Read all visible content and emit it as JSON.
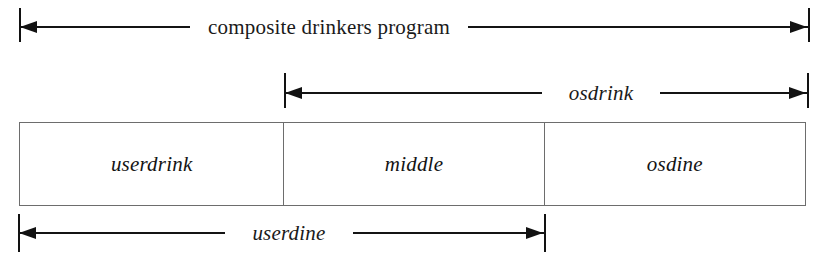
{
  "diagram": {
    "background_color": "#ffffff",
    "line_color": "#121212",
    "box_border_color": "#6d6d6d",
    "measures": [
      {
        "id": "composite-drinkers-program",
        "label": "composite drinkers program",
        "style": "roman",
        "start_x": 19,
        "end_x": 810,
        "line_y": 27,
        "tick_top": 8,
        "tick_height": 34,
        "label_center_x": 410,
        "arrow_ends": "both"
      },
      {
        "id": "osdrink",
        "label": "osdrink",
        "style": "italic",
        "start_x": 284,
        "end_x": 809,
        "line_y": 93,
        "tick_top": 73,
        "tick_height": 35,
        "label_center_x": 592,
        "arrow_ends": "both"
      },
      {
        "id": "userdine",
        "label": "userdine",
        "style": "italic",
        "start_x": 18,
        "end_x": 546,
        "line_y": 233,
        "tick_top": 214,
        "tick_height": 38,
        "label_center_x": 283,
        "arrow_ends": "both"
      }
    ],
    "bar": {
      "left": 19,
      "top": 122,
      "width": 787,
      "height": 84,
      "segments": [
        {
          "id": "userdrink",
          "label": "userdrink",
          "width": 265
        },
        {
          "id": "middle",
          "label": "middle",
          "width": 261
        },
        {
          "id": "osdine",
          "label": "osdine",
          "width": 261
        }
      ]
    }
  }
}
